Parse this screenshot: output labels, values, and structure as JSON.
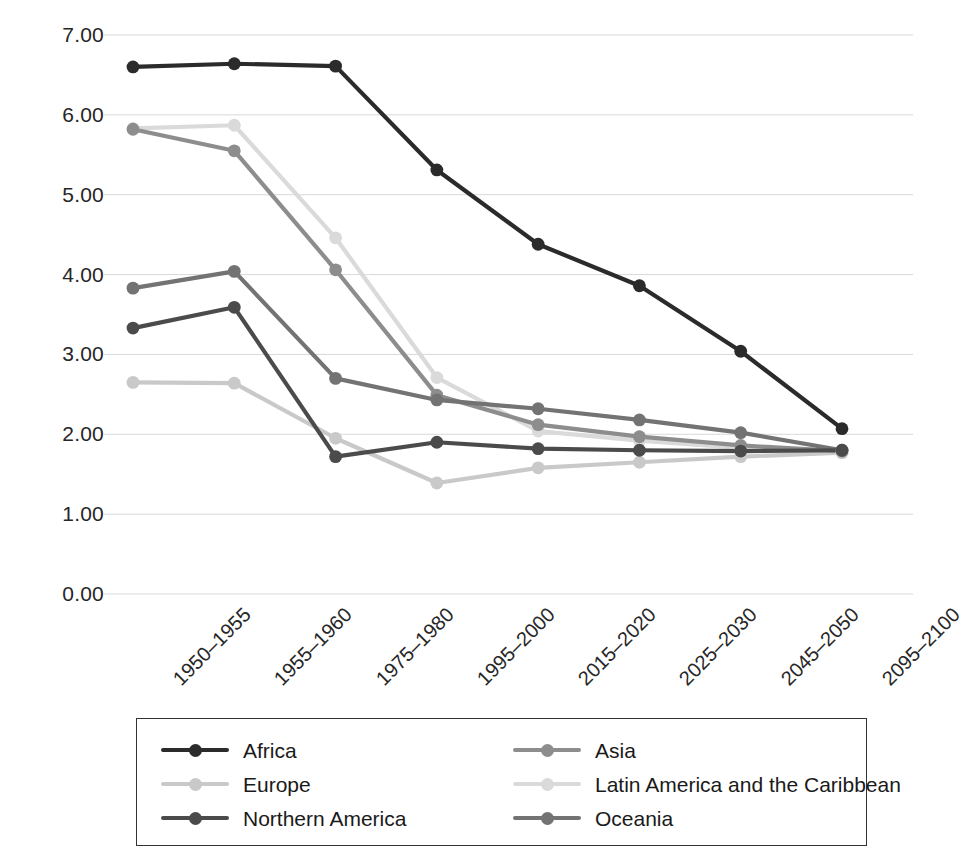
{
  "chart_data": {
    "type": "line",
    "title": "",
    "xlabel": "",
    "ylabel": "",
    "ylim": [
      0,
      7
    ],
    "ytick_step": 1,
    "grid": true,
    "legend_position": "bottom",
    "ytick_labels": [
      "7.00",
      "6.00",
      "5.00",
      "4.00",
      "3.00",
      "2.00",
      "1.00",
      "0.00"
    ],
    "ytick_values": [
      7,
      6,
      5,
      4,
      3,
      2,
      1,
      0
    ],
    "categories": [
      "1950–1955",
      "1955–1960",
      "1975–1980",
      "1995–2000",
      "2015–2020",
      "2025–2030",
      "2045–2050",
      "2095–2100"
    ],
    "series": [
      {
        "name": "Africa",
        "color": "#2b2b2b",
        "values": [
          6.6,
          6.64,
          6.61,
          5.31,
          4.38,
          3.86,
          3.04,
          2.07
        ]
      },
      {
        "name": "Asia",
        "color": "#8d8d8d",
        "values": [
          5.82,
          5.55,
          4.06,
          2.49,
          2.12,
          1.97,
          1.86,
          1.79
        ]
      },
      {
        "name": "Europe",
        "color": "#c9c9c9",
        "values": [
          2.65,
          2.64,
          1.95,
          1.39,
          1.58,
          1.65,
          1.72,
          1.77
        ]
      },
      {
        "name": "Latin America and the Caribbean",
        "color": "#dadada",
        "values": [
          5.83,
          5.87,
          4.46,
          2.71,
          2.04,
          1.92,
          1.83,
          1.77
        ]
      },
      {
        "name": "Northern America",
        "color": "#4b4b4b",
        "values": [
          3.33,
          3.59,
          1.72,
          1.9,
          1.82,
          1.8,
          1.79,
          1.8
        ]
      },
      {
        "name": "Oceania",
        "color": "#737373",
        "values": [
          3.83,
          4.04,
          2.7,
          2.43,
          2.32,
          2.18,
          2.02,
          1.8
        ]
      }
    ]
  },
  "legend": {
    "items": [
      {
        "label": "Africa",
        "color": "#2b2b2b"
      },
      {
        "label": "Asia",
        "color": "#8d8d8d"
      },
      {
        "label": "Europe",
        "color": "#c9c9c9"
      },
      {
        "label": "Latin America and the Caribbean",
        "color": "#dadada"
      },
      {
        "label": "Northern America",
        "color": "#4b4b4b"
      },
      {
        "label": "Oceania",
        "color": "#737373"
      }
    ],
    "order": [
      0,
      1,
      2,
      3,
      4,
      5
    ]
  },
  "axes": {
    "gridline_color": "#d9d9d9",
    "label_color": "#262626"
  }
}
